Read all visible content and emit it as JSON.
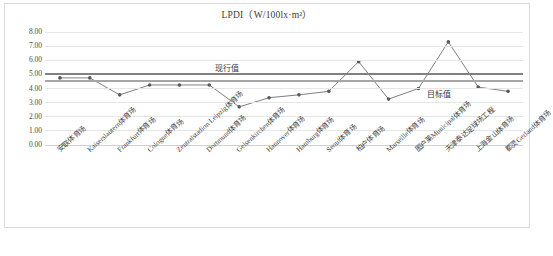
{
  "chart_data": {
    "type": "line",
    "title": "LPDI（W/100lx·m²）",
    "xlabel": "",
    "ylabel": "",
    "ylim": [
      0.0,
      8.0
    ],
    "ytick_labels": [
      "8.00",
      "7.00",
      "6.00",
      "5.00",
      "4.00",
      "3.00",
      "2.00",
      "1.00",
      "0.00"
    ],
    "ytick_values": [
      8.0,
      7.0,
      6.0,
      5.0,
      4.0,
      3.0,
      2.0,
      1.0,
      0.0
    ],
    "grid": true,
    "legend": "none",
    "categories": [
      "安联体育场",
      "Kaiserslautern体育场",
      "Frankfurt体育场",
      "Cologne体育场",
      "Zentralstadion Leipzig体育场",
      "Dortmund体育场",
      "Gelsenkirchen体育场",
      "Hannover体育场",
      "Hamburg体育场",
      "Seoul体育场",
      "柏户体育场",
      "Marseille体育场",
      "图户莱Municipal体育场",
      "天津泰达足球场工程",
      "上海金山体育场",
      "都灵Gerland体育场"
    ],
    "series": [
      {
        "name": "LPDI",
        "values": [
          4.75,
          4.75,
          3.55,
          4.25,
          4.25,
          4.25,
          2.7,
          3.35,
          3.55,
          3.8,
          5.9,
          3.25,
          4.0,
          7.3,
          4.1,
          3.8
        ]
      }
    ],
    "reference_lines": [
      {
        "name": "现行值",
        "label": "现行值",
        "value": 5.0,
        "color": "#808080"
      },
      {
        "name": "目标值",
        "label": "目标值",
        "value": 4.5,
        "color": "#a6a6a6"
      }
    ]
  },
  "annotations": {
    "current_label": "现行值",
    "target_label": "目标值"
  },
  "colors": {
    "series_line": "#808080",
    "marker": "#595959",
    "gridline": "#e6e6e6",
    "border": "#d9d9d9"
  }
}
